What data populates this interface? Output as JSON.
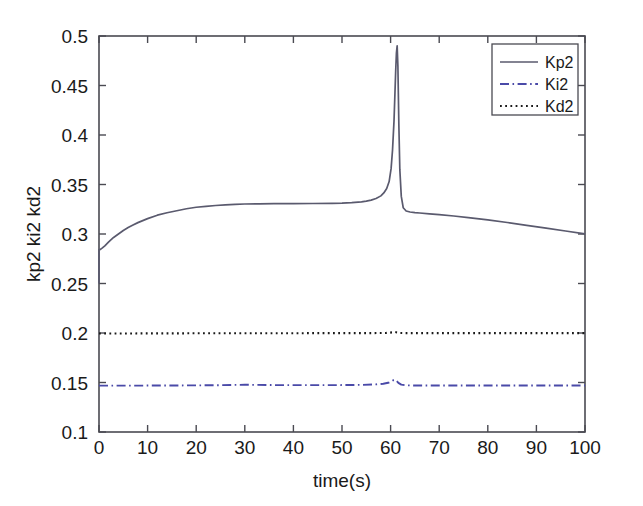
{
  "chart_data": {
    "type": "line",
    "title": "",
    "xlabel": "time(s)",
    "ylabel": "kp2 ki2 kd2",
    "xlim": [
      0,
      100
    ],
    "ylim": [
      0.1,
      0.5
    ],
    "xticks": [
      0,
      10,
      20,
      30,
      40,
      50,
      60,
      70,
      80,
      90,
      100
    ],
    "xtick_labels": [
      "0",
      "10",
      "20",
      "30",
      "40",
      "50",
      "60",
      "70",
      "80",
      "90",
      "100"
    ],
    "yticks": [
      0.1,
      0.15,
      0.2,
      0.25,
      0.3,
      0.35,
      0.4,
      0.45,
      0.5
    ],
    "ytick_labels": [
      "0.1",
      "0.15",
      "0.2",
      "0.25",
      "0.3",
      "0.35",
      "0.4",
      "0.45",
      "0.5"
    ],
    "grid": false,
    "legend_position": "upper right",
    "legend_entries": [
      "Kp2",
      "Ki2",
      "Kd2"
    ],
    "series": [
      {
        "name": "Kp2",
        "style": "solid",
        "color": "#5a5a6e",
        "x": [
          0,
          0,
          0.3,
          0.7,
          1.2,
          2,
          3,
          4,
          5,
          6,
          7,
          8,
          10,
          12,
          14,
          16,
          18,
          20,
          22,
          24,
          26,
          28,
          30,
          33,
          36,
          40,
          44,
          48,
          50,
          52,
          54,
          55,
          56,
          57,
          58,
          58.6,
          59.2,
          59.7,
          60.1,
          60.4,
          60.7,
          60.9,
          61.05,
          61.2,
          61.35,
          61.5,
          61.7,
          61.9,
          62.2,
          62.6,
          63.2,
          64,
          65,
          66,
          68,
          70,
          73,
          76,
          80,
          84,
          88,
          92,
          96,
          100
        ],
        "y": [
          0.25,
          0.284,
          0.2845,
          0.286,
          0.288,
          0.292,
          0.2965,
          0.3,
          0.3035,
          0.3065,
          0.309,
          0.3115,
          0.3155,
          0.319,
          0.3215,
          0.3235,
          0.3255,
          0.327,
          0.328,
          0.3288,
          0.3295,
          0.33,
          0.3303,
          0.3305,
          0.3306,
          0.3307,
          0.3308,
          0.331,
          0.3312,
          0.3317,
          0.3325,
          0.3332,
          0.3342,
          0.3358,
          0.3385,
          0.3415,
          0.346,
          0.353,
          0.366,
          0.385,
          0.414,
          0.443,
          0.465,
          0.483,
          0.49,
          0.47,
          0.41,
          0.365,
          0.338,
          0.3265,
          0.3232,
          0.3222,
          0.3216,
          0.3212,
          0.3204,
          0.3196,
          0.3182,
          0.3166,
          0.3142,
          0.3116,
          0.3088,
          0.306,
          0.303,
          0.3002
        ]
      },
      {
        "name": "Ki2",
        "style": "dashdot",
        "color": "#4a4aa8",
        "x": [
          0,
          5,
          10,
          15,
          20,
          25,
          28,
          30,
          32,
          36,
          40,
          45,
          50,
          54,
          57,
          58.5,
          59.5,
          60.2,
          60.6,
          60.9,
          61.2,
          61.6,
          62.2,
          63,
          65,
          70,
          75,
          80,
          85,
          90,
          95,
          100
        ],
        "y": [
          0.1468,
          0.1468,
          0.1469,
          0.147,
          0.1471,
          0.1473,
          0.1476,
          0.1477,
          0.1476,
          0.1474,
          0.1473,
          0.1473,
          0.1474,
          0.1476,
          0.1481,
          0.1487,
          0.1497,
          0.1512,
          0.1524,
          0.1528,
          0.1518,
          0.1496,
          0.1478,
          0.1472,
          0.147,
          0.1469,
          0.1469,
          0.1469,
          0.1469,
          0.1469,
          0.1469,
          0.1469
        ]
      },
      {
        "name": "Kd2",
        "style": "dotted",
        "color": "#1a1a1a",
        "x": [
          0,
          10,
          20,
          30,
          40,
          50,
          56,
          59,
          60.3,
          60.8,
          61.3,
          62,
          63,
          70,
          80,
          90,
          100
        ],
        "y": [
          0.1995,
          0.1996,
          0.1997,
          0.1998,
          0.1998,
          0.1999,
          0.1999,
          0.2,
          0.2006,
          0.2011,
          0.2006,
          0.2,
          0.1999,
          0.1999,
          0.1999,
          0.1999,
          0.1999
        ]
      }
    ],
    "annotations": [
      {
        "text": "Kp2 initial transient vertical jump at t=0 from 0.25 to 0.284"
      },
      {
        "text": "Kp2 sharp peak near t=61 reaching 0.49"
      }
    ]
  },
  "axes": {
    "x_title": "time(s)",
    "y_title": "kp2 ki2 kd2"
  },
  "legend": {
    "items": [
      {
        "label": "Kp2",
        "style": "solid",
        "color": "#5a5a6e"
      },
      {
        "label": "Ki2",
        "style": "dashdot",
        "color": "#4a4aa8"
      },
      {
        "label": "Kd2",
        "style": "dotted",
        "color": "#1a1a1a"
      }
    ]
  },
  "colors": {
    "background": "#ffffff",
    "axis": "#4a4a52",
    "text": "#1a1a1a",
    "kp2": "#5a5a6e",
    "ki2": "#4a4aa8",
    "kd2": "#1a1a1a"
  }
}
